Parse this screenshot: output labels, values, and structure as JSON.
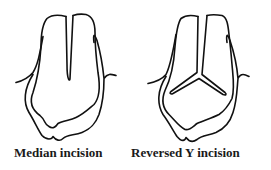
{
  "figures": [
    {
      "id": "median",
      "caption": "Median incision",
      "incision_type": "straight-midline"
    },
    {
      "id": "reversed-y",
      "caption": "Reversed Y incision",
      "incision_type": "reversed-y"
    }
  ],
  "colors": {
    "line": "#111111",
    "text": "#1a1a1a",
    "background": "#ffffff"
  }
}
